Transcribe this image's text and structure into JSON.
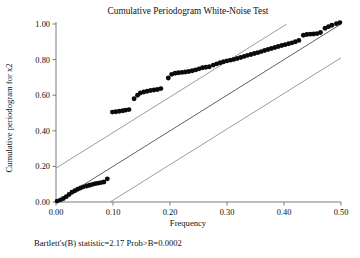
{
  "chart_data": {
    "type": "scatter",
    "title": "Cumulative Periodogram White-Noise Test",
    "xlabel": "Frequency",
    "ylabel": "Cumulative periodogram for x2",
    "xlim": [
      0.0,
      0.5
    ],
    "ylim": [
      0.0,
      1.0
    ],
    "xticks": [
      0.0,
      0.1,
      0.2,
      0.3,
      0.4,
      0.5
    ],
    "xtick_labels": [
      "0.00",
      "0.10",
      "0.20",
      "0.30",
      "0.40",
      "0.50"
    ],
    "yticks": [
      0.0,
      0.2,
      0.4,
      0.6,
      0.8,
      1.0
    ],
    "ytick_labels": [
      "0.00",
      "0.20",
      "0.40",
      "0.60",
      "0.80",
      "1.00"
    ],
    "grid": false,
    "legend": "none",
    "annotation": "Bartlett's(B) statistic=2.17 Prob>B=0.0002",
    "series": [
      {
        "name": "Cumulative periodogram",
        "marker": "filled-circle",
        "color": "#0b0b0b",
        "x": [
          0.002,
          0.008,
          0.013,
          0.018,
          0.023,
          0.028,
          0.033,
          0.038,
          0.043,
          0.048,
          0.054,
          0.059,
          0.064,
          0.069,
          0.074,
          0.079,
          0.084,
          0.09,
          0.099,
          0.105,
          0.111,
          0.117,
          0.122,
          0.128,
          0.137,
          0.143,
          0.148,
          0.154,
          0.16,
          0.166,
          0.172,
          0.178,
          0.184,
          0.197,
          0.203,
          0.209,
          0.215,
          0.221,
          0.227,
          0.233,
          0.239,
          0.245,
          0.251,
          0.257,
          0.263,
          0.269,
          0.276,
          0.282,
          0.288,
          0.294,
          0.3,
          0.306,
          0.312,
          0.318,
          0.324,
          0.33,
          0.336,
          0.342,
          0.348,
          0.354,
          0.36,
          0.366,
          0.372,
          0.378,
          0.384,
          0.39,
          0.396,
          0.402,
          0.408,
          0.414,
          0.42,
          0.426,
          0.434,
          0.44,
          0.446,
          0.452,
          0.458,
          0.464,
          0.472,
          0.478,
          0.484,
          0.492,
          0.498
        ],
        "y": [
          0.005,
          0.012,
          0.02,
          0.03,
          0.042,
          0.055,
          0.063,
          0.072,
          0.079,
          0.085,
          0.09,
          0.094,
          0.099,
          0.103,
          0.106,
          0.109,
          0.112,
          0.13,
          0.505,
          0.507,
          0.51,
          0.513,
          0.516,
          0.519,
          0.58,
          0.6,
          0.612,
          0.618,
          0.622,
          0.626,
          0.629,
          0.632,
          0.637,
          0.697,
          0.717,
          0.723,
          0.726,
          0.728,
          0.73,
          0.733,
          0.737,
          0.742,
          0.748,
          0.754,
          0.757,
          0.76,
          0.769,
          0.776,
          0.782,
          0.788,
          0.793,
          0.797,
          0.801,
          0.806,
          0.812,
          0.818,
          0.824,
          0.829,
          0.834,
          0.839,
          0.845,
          0.851,
          0.857,
          0.862,
          0.868,
          0.874,
          0.879,
          0.884,
          0.889,
          0.894,
          0.9,
          0.908,
          0.937,
          0.941,
          0.943,
          0.944,
          0.946,
          0.952,
          0.976,
          0.985,
          0.993,
          1.002,
          1.008
        ]
      }
    ],
    "reference_lines": [
      {
        "name": "upper-confidence-band",
        "type": "linear",
        "slope": 2.0,
        "intercept": 0.19
      },
      {
        "name": "center-diagonal",
        "type": "linear",
        "slope": 2.0,
        "intercept": 0.0
      },
      {
        "name": "lower-confidence-band",
        "type": "linear",
        "slope": 2.0,
        "intercept": -0.19
      }
    ]
  },
  "chart": {
    "title": "Cumulative Periodogram White-Noise Test",
    "xlabel": "Frequency",
    "ylabel": "Cumulative periodogram for x2",
    "footnote": "Bartlett's(B) statistic=2.17 Prob>B=0.0002"
  }
}
